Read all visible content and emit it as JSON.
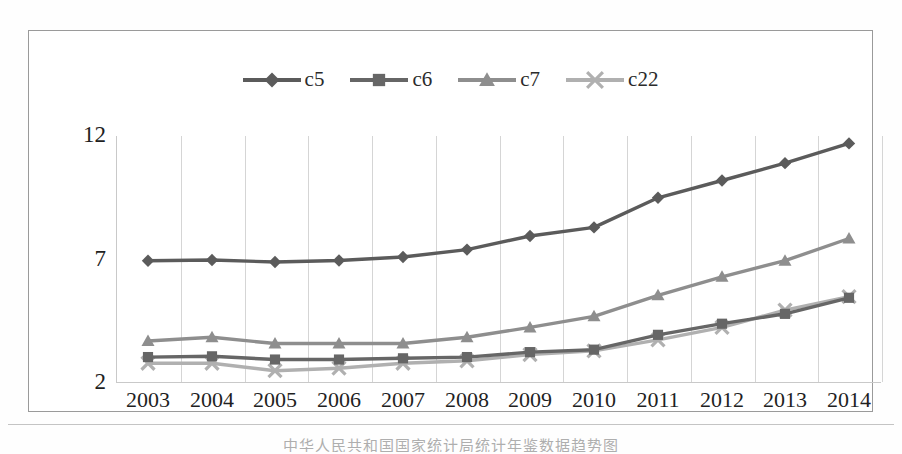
{
  "figure": {
    "caption": "中华人民共和国国家统计局统计年鉴数据趋势图",
    "y_axis": {
      "ticks": [
        "12",
        "7",
        "2"
      ],
      "min": 2,
      "max": 12
    },
    "x_axis": {
      "ticks": [
        "2003",
        "2004",
        "2005",
        "2006",
        "2007",
        "2008",
        "2009",
        "2010",
        "2011",
        "2012",
        "2013",
        "2014"
      ]
    },
    "legend": [
      {
        "label": "c5",
        "marker": "diamond-marker",
        "color": "#5b5b5b"
      },
      {
        "label": "c6",
        "marker": "square-marker",
        "color": "#666666"
      },
      {
        "label": "c7",
        "marker": "triangle-marker",
        "color": "#8e8e8e"
      },
      {
        "label": "c22",
        "marker": "x-marker",
        "color": "#b0b0b0"
      }
    ]
  },
  "chart_data": {
    "type": "line",
    "title": "",
    "xlabel": "",
    "ylabel": "",
    "x": [
      "2003",
      "2004",
      "2005",
      "2006",
      "2007",
      "2008",
      "2009",
      "2010",
      "2011",
      "2012",
      "2013",
      "2014"
    ],
    "categories": [
      "2003",
      "2004",
      "2005",
      "2006",
      "2007",
      "2008",
      "2009",
      "2010",
      "2011",
      "2012",
      "2013",
      "2014"
    ],
    "ylim": [
      2,
      12
    ],
    "yticks": [
      2,
      7,
      12
    ],
    "grid": "vertical",
    "legend_position": "top-center",
    "series": [
      {
        "name": "c5",
        "marker": "diamond",
        "color": "#5b5b5b",
        "values": [
          6.95,
          6.98,
          6.9,
          6.96,
          7.1,
          7.4,
          7.95,
          8.3,
          9.5,
          10.2,
          10.9,
          11.7
        ]
      },
      {
        "name": "c6",
        "marker": "square",
        "color": "#666666",
        "values": [
          3.05,
          3.08,
          2.95,
          2.95,
          3.0,
          3.05,
          3.25,
          3.35,
          3.95,
          4.4,
          4.8,
          5.45
        ]
      },
      {
        "name": "c7",
        "marker": "triangle",
        "color": "#8e8e8e",
        "values": [
          3.7,
          3.85,
          3.6,
          3.6,
          3.6,
          3.85,
          4.25,
          4.7,
          5.55,
          6.3,
          6.95,
          7.85
        ]
      },
      {
        "name": "c22",
        "marker": "x",
        "color": "#b0b0b0",
        "values": [
          2.8,
          2.8,
          2.5,
          2.6,
          2.8,
          2.9,
          3.15,
          3.3,
          3.75,
          4.25,
          4.95,
          5.5
        ]
      }
    ]
  }
}
